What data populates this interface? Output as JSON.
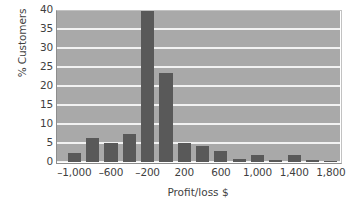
{
  "chart_data": {
    "type": "bar",
    "title": "",
    "subtitle": "",
    "xlabel": "Profit/loss $",
    "ylabel": "% Customers",
    "xlim": [
      -1200,
      1900
    ],
    "ylim": [
      0,
      40
    ],
    "ytick_values": [
      0,
      5,
      10,
      15,
      20,
      25,
      30,
      35,
      40
    ],
    "ytick_labels": [
      "0",
      "5",
      "10",
      "15",
      "20",
      "25",
      "30",
      "35",
      "40"
    ],
    "xtick_values": [
      -1000,
      -600,
      -200,
      200,
      600,
      1000,
      1400,
      1800
    ],
    "xtick_labels": [
      "–1,000",
      "–600",
      "–200",
      "200",
      "600",
      "1,000",
      "1,400",
      "1,800"
    ],
    "bin_width": 200,
    "grid": "horizontal",
    "legend": "none",
    "bar_color": "#595959",
    "plot_background": "#a9a9a9",
    "gridline_color": "#f2f2f2",
    "categories": [
      -1000,
      -800,
      -600,
      -400,
      -200,
      0,
      200,
      400,
      600,
      800,
      1000,
      1200,
      1400,
      1600,
      1800
    ],
    "values": [
      2.3,
      6.2,
      5.1,
      7.5,
      40.5,
      23.5,
      5.0,
      4.2,
      3.0,
      0.7,
      1.8,
      0.6,
      1.8,
      0.6,
      0.2
    ],
    "series": [
      {
        "name": "% Customers",
        "values": [
          2.3,
          6.2,
          5.1,
          7.5,
          40.5,
          23.5,
          5.0,
          4.2,
          3.0,
          0.7,
          1.8,
          0.6,
          1.8,
          0.6,
          0.2
        ]
      }
    ]
  }
}
